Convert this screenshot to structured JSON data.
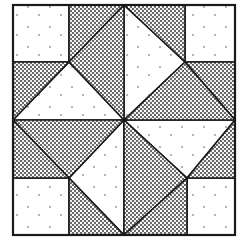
{
  "diagram": {
    "title": "Quilt block pattern",
    "type": "quilt-block",
    "colors": {
      "background": "#ffffff",
      "outline": "#1a1a1a",
      "dotted_fill": "#8a8a8a",
      "dotted_dot": "#1a1a1a",
      "white_fill": "#ffffff",
      "sparse_dot": "#555555"
    },
    "bounds": {
      "x0": 13,
      "y0": 5,
      "x1": 235,
      "y1": 235,
      "mx": 124,
      "my": 120
    },
    "pieces": [
      {
        "name": "square-top-left",
        "fill": "white",
        "points": "13,5 69,5 69,62 13,62"
      },
      {
        "name": "square-top-right",
        "fill": "white",
        "points": "185,5 235,5 235,62 185,62"
      },
      {
        "name": "square-bottom-right",
        "fill": "white",
        "points": "187,178 235,178 235,235 187,235"
      },
      {
        "name": "square-bottom-left",
        "fill": "white",
        "points": "13,178 69,178 69,235 13,235"
      },
      {
        "name": "triangle-white-top-left",
        "fill": "white",
        "points": "69,62 124,120 13,120"
      },
      {
        "name": "triangle-white-top-right",
        "fill": "white",
        "points": "124,5 185,62 124,120"
      },
      {
        "name": "triangle-white-bottom-right",
        "fill": "white",
        "points": "124,120 235,120 187,178"
      },
      {
        "name": "triangle-white-bottom-left",
        "fill": "white",
        "points": "124,120 124,235 69,178"
      },
      {
        "name": "dotted-tl-a",
        "fill": "dotted",
        "points": "69,5 124,5 69,62"
      },
      {
        "name": "dotted-tl-b",
        "fill": "dotted",
        "points": "124,5 124,120 69,62"
      },
      {
        "name": "dotted-tl-c",
        "fill": "dotted",
        "points": "13,62 69,62 13,120"
      },
      {
        "name": "dotted-tr-a",
        "fill": "dotted",
        "points": "124,5 185,5 185,62"
      },
      {
        "name": "dotted-tr-b",
        "fill": "dotted",
        "points": "185,62 235,62 235,120"
      },
      {
        "name": "dotted-tr-c",
        "fill": "dotted",
        "points": "124,120 185,62 235,120"
      },
      {
        "name": "dotted-br-a",
        "fill": "dotted",
        "points": "235,120 235,178 187,178"
      },
      {
        "name": "dotted-br-b",
        "fill": "dotted",
        "points": "124,120 187,178 124,235"
      },
      {
        "name": "dotted-br-c",
        "fill": "dotted",
        "points": "187,178 187,235 124,235"
      },
      {
        "name": "dotted-bl-a",
        "fill": "dotted",
        "points": "13,120 124,120 69,178"
      },
      {
        "name": "dotted-bl-b",
        "fill": "dotted",
        "points": "13,120 69,178 13,178"
      },
      {
        "name": "dotted-bl-c",
        "fill": "dotted",
        "points": "69,178 124,235 69,235"
      }
    ]
  }
}
